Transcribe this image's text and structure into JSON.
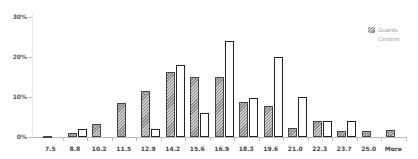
{
  "chart_data": {
    "type": "bar",
    "title": "",
    "xlabel": "",
    "ylabel": "",
    "ylim": [
      0,
      30
    ],
    "y_ticks": [
      "0%",
      "10%",
      "20%",
      "30%"
    ],
    "categories": [
      "7.5",
      "8.8",
      "10.2",
      "11.5",
      "12.9",
      "14.2",
      "15.6",
      "16.9",
      "18.3",
      "19.6",
      "21.0",
      "22.3",
      "23.7",
      "25.0",
      "More"
    ],
    "series": [
      {
        "name": "Guards",
        "style": "hatched",
        "values": [
          0.3,
          1.0,
          3.3,
          8.5,
          11.5,
          16.3,
          15.0,
          15.0,
          8.8,
          7.8,
          2.2,
          4.0,
          1.5,
          1.5,
          1.8
        ]
      },
      {
        "name": "Centers",
        "style": "outline",
        "values": [
          0,
          2.0,
          0,
          0,
          2.0,
          18.0,
          6.0,
          24.0,
          9.8,
          20.0,
          10.0,
          4.0,
          4.0,
          0,
          0
        ]
      }
    ],
    "legend_position": "top-right",
    "grid": false
  },
  "legend": {
    "items": [
      {
        "label": "Guards"
      },
      {
        "label": "Centers"
      }
    ]
  }
}
